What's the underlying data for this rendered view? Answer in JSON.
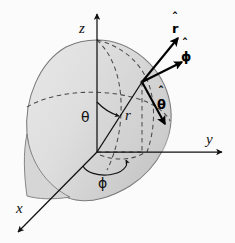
{
  "figure": {
    "background_color": "#fbfbfb",
    "surface_fill_light": "#e2e2e2",
    "surface_fill_dark": "#c9c9c9",
    "outline_color": "#6f6f6f",
    "line_color": "#1a1a1a",
    "dashed_color": "#4a4a4a"
  },
  "axes": [
    {
      "name": "x",
      "label": "x",
      "direction": "down-left"
    },
    {
      "name": "y",
      "label": "y",
      "direction": "right"
    },
    {
      "name": "z",
      "label": "z",
      "direction": "up"
    }
  ],
  "coordinates": {
    "radius": {
      "symbol": "r",
      "label": "r"
    },
    "polar_angle": {
      "symbol": "theta",
      "label": "θ"
    },
    "azimuthal_angle": {
      "symbol": "phi",
      "label": "ϕ"
    }
  },
  "unit_vectors": [
    {
      "name": "r-hat",
      "base": "r",
      "label": "r",
      "hat": "ˆ"
    },
    {
      "name": "phi-hat",
      "base": "phi",
      "label": "ϕ",
      "hat": "ˆ"
    },
    {
      "name": "theta-hat",
      "base": "theta",
      "label": "θ",
      "hat": "ˆ"
    }
  ]
}
